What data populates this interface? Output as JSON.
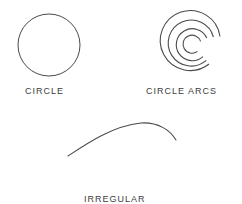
{
  "figure": {
    "background_color": "#ffffff",
    "stroke_color": "#4a4a4a",
    "text_color": "#3c3c3c",
    "width": 242,
    "height": 204,
    "items": [
      {
        "name": "circle",
        "label": "CIRCLE",
        "shape_type": "circle",
        "center_x": 49,
        "center_y": 45,
        "radius": 31
      },
      {
        "name": "circle-arcs",
        "label": "CIRCLE ARCS",
        "shape_type": "concentric-arcs",
        "center_x": 192,
        "center_y": 45,
        "ring_count": 4,
        "radii": [
          9,
          16,
          23,
          30
        ]
      },
      {
        "name": "irregular-curve-arc",
        "label_line1": "IRREGULAR",
        "label_line2": "CURVE ARC",
        "shape_type": "open-curve",
        "start_x": 68,
        "start_y": 156,
        "peak_x": 141,
        "peak_y": 123,
        "end_x": 176,
        "end_y": 140
      }
    ]
  }
}
